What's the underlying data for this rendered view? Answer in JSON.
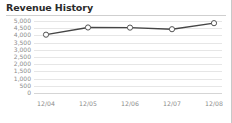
{
  "widget": {
    "title": "Revenue History"
  },
  "chart_data": {
    "type": "line",
    "title": "Revenue History",
    "xlabel": "",
    "ylabel": "",
    "categories": [
      "12/04",
      "12/05",
      "12/06",
      "12/07",
      "12/08"
    ],
    "values": [
      4050,
      4550,
      4540,
      4430,
      4850
    ],
    "series": [
      {
        "name": "Revenue",
        "values": [
          4050,
          4550,
          4540,
          4430,
          4850
        ]
      }
    ],
    "ylim": [
      0,
      5000
    ],
    "yticks": [
      0,
      500,
      1000,
      1500,
      2000,
      2500,
      3000,
      3500,
      4000,
      4500,
      5000
    ],
    "ytick_labels": [
      "0",
      "500",
      "1,000",
      "1,500",
      "2,000",
      "2,500",
      "3,000",
      "3,500",
      "4,000",
      "4,500",
      "5,000"
    ],
    "grid": true,
    "legend": false,
    "legend_position": "none",
    "marker": "open-circle",
    "line_color": "#454545",
    "marker_fill": "#ffffff",
    "marker_stroke": "#555555",
    "grid_color": "#e6e6e6",
    "tick_label_color": "#8c8c8c",
    "title_color": "#2b2b2b"
  }
}
